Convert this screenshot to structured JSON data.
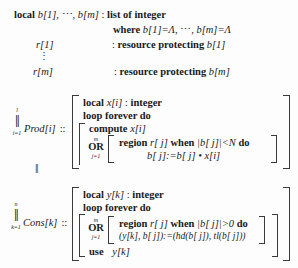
{
  "figure": {
    "kind": "pseudocode-listing",
    "language": "concurrent-pascal-like",
    "ink_color": "#1a1a1a",
    "paper_color": "#fdfdfd"
  },
  "declarations": {
    "buffer": {
      "keyword": "local",
      "names": "b[1],",
      "ellipsis": "⋯,",
      "names2": "b[m]",
      "colon": ":",
      "type": "list of integer"
    },
    "where": {
      "keyword": "where",
      "init1": "b[1]=Λ,",
      "ellipsis": "⋯,",
      "init2": "b[m]=Λ"
    },
    "resource_first": {
      "name": "r[1]",
      "colon": ":",
      "keyword": "resource protecting",
      "target": "b[1]"
    },
    "vdots": "⋮",
    "resource_last": {
      "name": "r[m]",
      "colon": ":",
      "keyword": "resource protecting",
      "target": "b[m]"
    }
  },
  "producer": {
    "quantifier": {
      "sup": "l",
      "glyph": "‖",
      "sub": "i=1"
    },
    "name": "Prod[i]",
    "dcolon": "::",
    "local_kw": "local",
    "local_var": "x[i]",
    "local_colon": ":",
    "local_type": "integer",
    "loop": "loop forever do",
    "compute_kw": "compute",
    "compute_var": "x[i]",
    "or": {
      "sup": "m",
      "glyph": "OR",
      "sub": "j=1"
    },
    "region_kw": "region",
    "region_res": "r[ j]",
    "when_kw": "when",
    "guard": "|b[ j]|<N",
    "do_kw": "do",
    "body": "b[ j]:=b[ j] • x[i]"
  },
  "separator": "‖",
  "consumer": {
    "quantifier": {
      "sup": "n",
      "glyph": "‖",
      "sub": "k=1"
    },
    "name": "Cons[k]",
    "dcolon": "::",
    "local_kw": "local",
    "local_var": "y[k]",
    "local_colon": ":",
    "local_type": "integer",
    "loop": "loop forever do",
    "or": {
      "sup": "m",
      "glyph": "OR",
      "sub": "j=1"
    },
    "region_kw": "region",
    "region_res": "r[ j]",
    "when_kw": "when",
    "guard": "|b[ j]|>0",
    "do_kw": "do",
    "body": "(y[k], b[ j]):=(hd(b[ j]), tl(b[ j]))",
    "use_kw": "use",
    "use_var": "y[k]"
  }
}
